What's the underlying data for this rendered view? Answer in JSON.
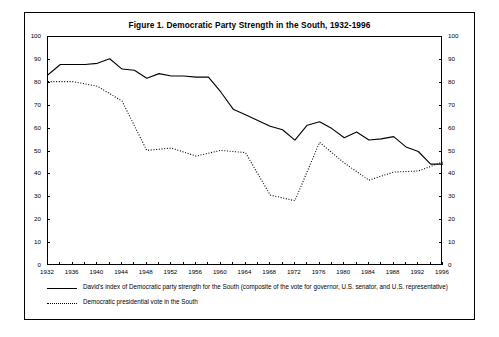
{
  "figure": {
    "title": "Figure 1.  Democratic Party Strength in the South, 1932-1996"
  },
  "axes": {
    "y_ticks": [
      0,
      10,
      20,
      30,
      40,
      50,
      60,
      70,
      80,
      90,
      100
    ],
    "x_tick_labels": [
      "1932",
      "1936",
      "1940",
      "1944",
      "1948",
      "1952",
      "1956",
      "1960",
      "1964",
      "1968",
      "1972",
      "1976",
      "1980",
      "1984",
      "1988",
      "1992",
      "1996"
    ]
  },
  "legend": {
    "items": [
      {
        "style": "solid",
        "label": "David's index of Democratic party strength for the South (composite of the vote for governor, U.S. senator, and U.S. representative)"
      },
      {
        "style": "dotted",
        "label": "Democratic presidential vote in the South"
      }
    ]
  },
  "chart_data": {
    "type": "line",
    "title": "Figure 1.  Democratic Party Strength in the South, 1932-1996",
    "xlabel": "",
    "ylabel": "",
    "xlim": [
      1932,
      1996
    ],
    "ylim": [
      0,
      100
    ],
    "ytick_step": 10,
    "xtick_step_labeled": 4,
    "xtick_step_minor": 2,
    "grid": false,
    "legend_position": "below-plot",
    "dual_y_axis": true,
    "series": [
      {
        "name": "David's index of Democratic party strength for the South (composite of the vote for governor, U.S. senator, and U.S. representative)",
        "style": "solid",
        "x": [
          1932,
          1934,
          1936,
          1938,
          1940,
          1942,
          1944,
          1946,
          1948,
          1950,
          1952,
          1954,
          1956,
          1958,
          1960,
          1962,
          1964,
          1966,
          1968,
          1970,
          1972,
          1974,
          1976,
          1978,
          1980,
          1982,
          1984,
          1986,
          1988,
          1990,
          1992,
          1994,
          1996
        ],
        "values": [
          83.5,
          88.0,
          88.0,
          88.0,
          88.5,
          90.5,
          86.0,
          85.5,
          82.0,
          84.0,
          83.0,
          83.0,
          82.5,
          82.5,
          76.0,
          68.5,
          66.0,
          63.5,
          61.0,
          59.5,
          55.0,
          61.5,
          63.0,
          60.0,
          56.0,
          58.5,
          55.0,
          55.5,
          56.5,
          52.0,
          50.0,
          44.5,
          44.5
        ]
      },
      {
        "name": "Democratic presidential vote in the South",
        "style": "dotted",
        "x": [
          1932,
          1936,
          1940,
          1944,
          1948,
          1952,
          1956,
          1960,
          1964,
          1968,
          1972,
          1976,
          1980,
          1984,
          1988,
          1992,
          1996
        ],
        "values": [
          80.5,
          80.5,
          78.5,
          72.0,
          50.5,
          51.5,
          48.0,
          50.5,
          49.5,
          31.0,
          28.5,
          54.0,
          45.0,
          37.5,
          41.0,
          41.5,
          45.5
        ]
      }
    ]
  },
  "colors": {
    "line": "#000000",
    "axis": "#000000",
    "background": "#ffffff"
  }
}
